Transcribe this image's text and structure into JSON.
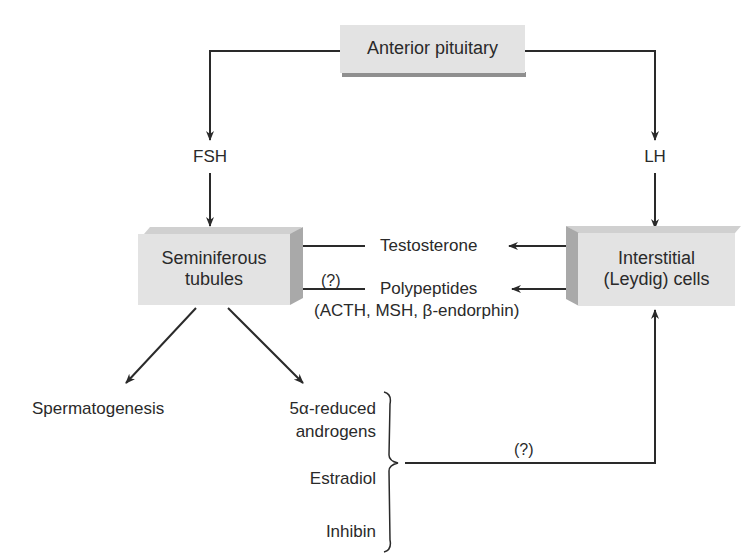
{
  "diagram": {
    "nodes": {
      "anterior_pituitary": "Anterior pituitary",
      "seminiferous_line1": "Seminiferous",
      "seminiferous_line2": "tubules",
      "interstitial_line1": "Interstitial",
      "interstitial_line2": "(Leydig) cells"
    },
    "labels": {
      "fsh": "FSH",
      "lh": "LH",
      "testosterone": "Testosterone",
      "polypeptides": "Polypeptides",
      "polypeptides_detail": "(ACTH, MSH, β-endorphin)",
      "polypeptides_question": "(?)",
      "spermatogenesis": "Spermatogenesis",
      "reduced_androgens_line1": "5α-reduced",
      "reduced_androgens_line2": "androgens",
      "estradiol": "Estradiol",
      "inhibin": "Inhibin",
      "feedback_question": "(?)"
    },
    "edges": [
      {
        "from": "Anterior pituitary",
        "to": "Seminiferous tubules",
        "via": "FSH"
      },
      {
        "from": "Anterior pituitary",
        "to": "Interstitial (Leydig) cells",
        "via": "LH"
      },
      {
        "from": "Interstitial (Leydig) cells",
        "to": "Seminiferous tubules",
        "via": "Testosterone"
      },
      {
        "from": "Interstitial (Leydig) cells",
        "to": "Seminiferous tubules",
        "via": "Polypeptides (ACTH, MSH, β-endorphin)",
        "uncertain": true
      },
      {
        "from": "Seminiferous tubules",
        "to": "Spermatogenesis"
      },
      {
        "from": "Seminiferous tubules",
        "to": "5α-reduced androgens"
      },
      {
        "from": "5α-reduced androgens / Estradiol / Inhibin",
        "to": "Interstitial (Leydig) cells",
        "uncertain": true
      }
    ],
    "colors": {
      "box_face": "#e3e3e3",
      "box_shade": "#a9a9a9",
      "line": "#2a2a2a",
      "text": "#2a2a2a"
    }
  }
}
